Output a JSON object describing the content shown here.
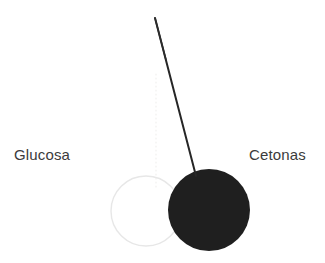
{
  "figure": {
    "background_color": "#ffffff",
    "width": 325,
    "height": 263,
    "labels": {
      "left": "Glucosa",
      "right": "Cetonas"
    },
    "elements": {
      "glucose_circle": {
        "name": "Glucosa",
        "style": "hollow outline circle",
        "stroke_color": "#e7e7e7",
        "fill": "none",
        "cx": 146,
        "cy": 211,
        "r": 35,
        "stroke_width": 1.4
      },
      "ketone_circle": {
        "name": "Cetonas",
        "style": "solid filled circle",
        "fill_color": "#1f1f1f",
        "cx": 209,
        "cy": 210,
        "r": 41
      },
      "needle": {
        "name": "pointer needle",
        "color": "#262626",
        "x1": 155,
        "y1": 18,
        "x2": 196,
        "y2": 176,
        "stroke_width": 2
      },
      "guide_line": {
        "name": "vertical dotted guide",
        "color": "#f0efee",
        "x": 156,
        "y1": 74,
        "y2": 188,
        "dash": "1 3"
      }
    }
  }
}
